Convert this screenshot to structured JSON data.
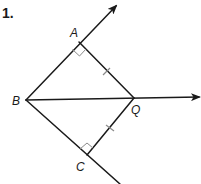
{
  "problem": {
    "number": "1."
  },
  "diagram": {
    "points": {
      "A": {
        "label": "A",
        "x": 79,
        "y": 42
      },
      "B": {
        "label": "B",
        "x": 26,
        "y": 100
      },
      "Q": {
        "label": "Q",
        "x": 134,
        "y": 98
      },
      "C": {
        "label": "C",
        "x": 87,
        "y": 155
      }
    },
    "rays": [
      {
        "name": "ray-BA",
        "from": "B",
        "through": "A",
        "arrow": true
      },
      {
        "name": "ray-BQ",
        "from": "B",
        "through": "Q",
        "arrow": true
      },
      {
        "name": "ray-BC",
        "from": "B",
        "through": "C",
        "arrow": false
      }
    ],
    "segments": [
      "AQ",
      "CQ"
    ],
    "right_angles": [
      "A",
      "C"
    ],
    "congruent_marks": [
      "AQ",
      "CQ"
    ],
    "colors": {
      "line": "#1a1a1a",
      "marks": "#8a8a8a",
      "background": "#ffffff"
    }
  }
}
